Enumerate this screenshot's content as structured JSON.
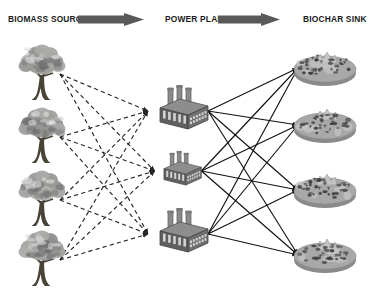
{
  "diagram": {
    "type": "bipartite-flow-diagram",
    "background": "#ffffff",
    "headers": [
      {
        "id": "biomass",
        "label": "BIOMASS SOURCE"
      },
      {
        "id": "plant",
        "label": "POWER PLANT"
      },
      {
        "id": "sink",
        "label": "BIOCHAR SINK"
      }
    ],
    "header_arrows": [
      {
        "id": "arrow-biomass-to-plant",
        "color": "#595959"
      },
      {
        "id": "arrow-plant-to-sink",
        "color": "#595959"
      }
    ],
    "colors": {
      "text": "#1a1a1a",
      "arrow_block": "#595959",
      "dashed_link": "#262626",
      "solid_link": "#111111",
      "tree_canopy": "#9a9a9a",
      "tree_trunk": "#4a4338",
      "plant_body": "#6e6e6e",
      "plant_top": "#8d8d8d",
      "plant_stack": "#8a8a8a",
      "sink_fill": "#a8a8a8",
      "sink_rim": "#8a8a8a",
      "speckle": "#3d3d3d"
    },
    "columns": {
      "biomass_sources": {
        "icon": "tree-icon",
        "count": 4,
        "nodes": [
          {
            "id": "tree-1",
            "label": "Biomass Source 1",
            "cx": 42,
            "cy": 72
          },
          {
            "id": "tree-2",
            "label": "Biomass Source 2",
            "cx": 42,
            "cy": 135
          },
          {
            "id": "tree-3",
            "label": "Biomass Source 3",
            "cx": 42,
            "cy": 198
          },
          {
            "id": "tree-4",
            "label": "Biomass Source 4",
            "cx": 42,
            "cy": 258
          }
        ]
      },
      "power_plants": {
        "icon": "factory-icon",
        "count": 3,
        "nodes": [
          {
            "id": "plant-1",
            "label": "Power Plant 1",
            "cx": 178,
            "cy": 110,
            "scale": 1.0
          },
          {
            "id": "plant-2",
            "label": "Power Plant 2",
            "cx": 178,
            "cy": 170,
            "scale": 0.78
          },
          {
            "id": "plant-3",
            "label": "Power Plant 3",
            "cx": 178,
            "cy": 233,
            "scale": 1.0
          }
        ]
      },
      "biochar_sinks": {
        "icon": "field-plot-icon",
        "count": 4,
        "nodes": [
          {
            "id": "sink-1",
            "label": "Biochar Sink 1",
            "cx": 325,
            "cy": 68
          },
          {
            "id": "sink-2",
            "label": "Biochar Sink 2",
            "cx": 325,
            "cy": 125
          },
          {
            "id": "sink-3",
            "label": "Biochar Sink 3",
            "cx": 325,
            "cy": 190
          },
          {
            "id": "sink-4",
            "label": "Biochar Sink 4",
            "cx": 325,
            "cy": 255
          }
        ]
      }
    },
    "links": {
      "biomass_to_plant": {
        "style": "dashed",
        "arrowhead": true,
        "description": "Every biomass source connects to every power plant",
        "pairs": [
          [
            "tree-1",
            "plant-1"
          ],
          [
            "tree-1",
            "plant-2"
          ],
          [
            "tree-1",
            "plant-3"
          ],
          [
            "tree-2",
            "plant-1"
          ],
          [
            "tree-2",
            "plant-2"
          ],
          [
            "tree-2",
            "plant-3"
          ],
          [
            "tree-3",
            "plant-1"
          ],
          [
            "tree-3",
            "plant-2"
          ],
          [
            "tree-3",
            "plant-3"
          ],
          [
            "tree-4",
            "plant-1"
          ],
          [
            "tree-4",
            "plant-2"
          ],
          [
            "tree-4",
            "plant-3"
          ]
        ]
      },
      "plant_to_sink": {
        "style": "solid",
        "arrowhead": true,
        "description": "Every power plant connects to every biochar sink",
        "pairs": [
          [
            "plant-1",
            "sink-1"
          ],
          [
            "plant-1",
            "sink-2"
          ],
          [
            "plant-1",
            "sink-3"
          ],
          [
            "plant-1",
            "sink-4"
          ],
          [
            "plant-2",
            "sink-1"
          ],
          [
            "plant-2",
            "sink-2"
          ],
          [
            "plant-2",
            "sink-3"
          ],
          [
            "plant-2",
            "sink-4"
          ],
          [
            "plant-3",
            "sink-1"
          ],
          [
            "plant-3",
            "sink-2"
          ],
          [
            "plant-3",
            "sink-3"
          ],
          [
            "plant-3",
            "sink-4"
          ]
        ]
      }
    }
  }
}
